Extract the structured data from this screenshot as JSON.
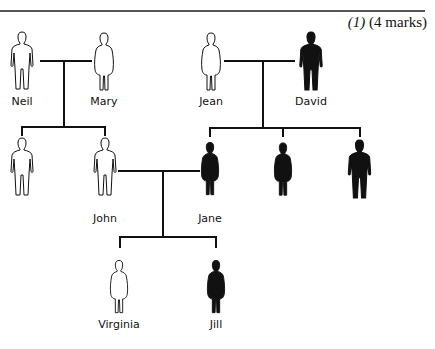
{
  "header": {
    "question_number": "(1)",
    "marks": "(4 marks)"
  },
  "legend_colors": {
    "affected": "#111111",
    "unaffected": "#ffffff"
  },
  "people": [
    {
      "id": "neil",
      "name": "Neil",
      "sex": "male",
      "affected": false,
      "generation": 1
    },
    {
      "id": "mary",
      "name": "Mary",
      "sex": "female",
      "affected": false,
      "generation": 1
    },
    {
      "id": "jean",
      "name": "Jean",
      "sex": "female",
      "affected": false,
      "generation": 1
    },
    {
      "id": "david",
      "name": "David",
      "sex": "male",
      "affected": true,
      "generation": 1
    },
    {
      "id": "gen2-son",
      "name": "",
      "sex": "male",
      "affected": false,
      "generation": 2
    },
    {
      "id": "john",
      "name": "John",
      "sex": "male",
      "affected": false,
      "generation": 2
    },
    {
      "id": "jane",
      "name": "Jane",
      "sex": "female",
      "affected": true,
      "generation": 2
    },
    {
      "id": "gen2-daughter",
      "name": "",
      "sex": "female",
      "affected": true,
      "generation": 2
    },
    {
      "id": "gen2-son-2",
      "name": "",
      "sex": "male",
      "affected": true,
      "generation": 2
    },
    {
      "id": "virginia",
      "name": "Virginia",
      "sex": "female",
      "affected": false,
      "generation": 3
    },
    {
      "id": "jill",
      "name": "Jill",
      "sex": "female",
      "affected": true,
      "generation": 3
    }
  ],
  "relationships": [
    {
      "parents": [
        "Neil",
        "Mary"
      ],
      "children": [
        "(unnamed son)",
        "John"
      ]
    },
    {
      "parents": [
        "Jean",
        "David"
      ],
      "children": [
        "Jane",
        "(unnamed daughter)",
        "(unnamed son)"
      ]
    },
    {
      "parents": [
        "John",
        "Jane"
      ],
      "children": [
        "Virginia",
        "Jill"
      ]
    }
  ]
}
